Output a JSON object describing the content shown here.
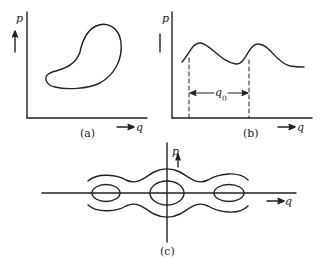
{
  "figure": {
    "panel_a": {
      "caption": "(a)",
      "y_axis_label": "p",
      "x_axis_label": "q",
      "description": "closed phase-space trajectory (kidney-shaped loop)"
    },
    "panel_b": {
      "caption": "(b)",
      "y_axis_label": "p",
      "x_axis_label": "q",
      "period_label": "q",
      "period_subscript": "0",
      "description": "periodic curve with period q0 marked by dashed lines"
    },
    "panel_c": {
      "caption": "(c)",
      "y_axis_label": "p",
      "x_axis_label": "q",
      "description": "chain of three closed orbits enclosed by two wavy open trajectories"
    },
    "colors": {
      "ink": "#222222",
      "background": "#ffffff"
    }
  }
}
